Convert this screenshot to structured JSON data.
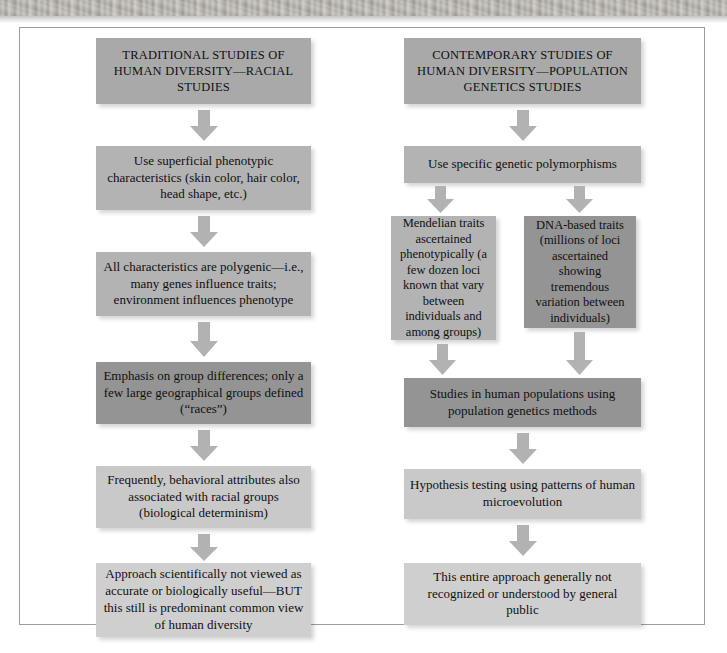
{
  "figure": {
    "type": "flowchart",
    "columns": 2
  },
  "colors": {
    "box_header": "#a9a9a9",
    "box_mid": "#b3b3b3",
    "box_dark": "#949494",
    "box_light": "#c9c9c9",
    "box_lighter": "#cfcfcf",
    "arrow": "#b0b0b0",
    "text": "#101010",
    "frame": "#9d9d9d",
    "page_background": "#ffffff"
  },
  "left_column": {
    "header": {
      "lines": [
        "TRADITIONAL STUDIES OF",
        "HUMAN DIVERSITY—",
        "RACIAL STUDIES"
      ],
      "text": "TRADITIONAL STUDIES OF HUMAN DIVERSITY—RACIAL STUDIES",
      "tone": "header"
    },
    "steps": [
      {
        "id": "left-step-1",
        "lines": [
          "Use superficial phenotypic",
          "characteristics (skin color, hair color,",
          "head shape, etc.)"
        ],
        "text": "Use superficial phenotypic characteristics (skin color, hair color, head shape, etc.)",
        "tone": "mid"
      },
      {
        "id": "left-step-2",
        "lines": [
          "All characteristics are polygenic—",
          "i.e., many genes influence traits;",
          "environment influences phenotype"
        ],
        "text": "All characteristics are polygenic—i.e., many genes influence traits; environment influences phenotype",
        "tone": "mid"
      },
      {
        "id": "left-step-3",
        "lines": [
          "Emphasis on group differences;",
          "only a few large geographical",
          "groups defined (“races”)"
        ],
        "text": "Emphasis on group differences; only a few large geographical groups defined (“races”)",
        "tone": "dark"
      },
      {
        "id": "left-step-4",
        "lines": [
          "Frequently, behavioral attributes",
          "also associated with racial groups",
          "(biological determinism)"
        ],
        "text": "Frequently, behavioral attributes also associated with racial groups (biological determinism)",
        "tone": "light"
      },
      {
        "id": "left-step-5",
        "lines": [
          "Approach scientifically not viewed",
          "as accurate or biologically useful—",
          "BUT this still is predominant",
          "common view of human diversity"
        ],
        "text": "Approach scientifically not viewed as accurate or biologically useful—BUT this still is predominant common view of human diversity",
        "tone": "lighter"
      }
    ]
  },
  "right_column": {
    "header": {
      "lines": [
        "CONTEMPORARY STUDIES OF",
        "HUMAN DIVERSITY—",
        "POPULATION GENETICS  STUDIES"
      ],
      "text": "CONTEMPORARY STUDIES OF HUMAN DIVERSITY—POPULATION GENETICS  STUDIES",
      "tone": "header"
    },
    "steps": [
      {
        "id": "right-step-1",
        "lines": [
          "Use specific genetic polymorphisms"
        ],
        "text": "Use specific genetic polymorphisms",
        "tone": "mid"
      },
      {
        "id": "right-branch-left",
        "lines": [
          "Mendelian traits",
          "ascertained pheno-",
          "typically (a few",
          "dozen loci known",
          "that vary between",
          "individuals and",
          "among groups)"
        ],
        "text": "Mendelian traits ascertained phenotypically (a few dozen loci known that vary between individuals and among groups)",
        "tone": "mid"
      },
      {
        "id": "right-branch-right",
        "lines": [
          "DNA-based traits",
          "(millions of loci",
          "ascertained show-",
          "ing tremendous",
          "variation between",
          "individuals)"
        ],
        "text": "DNA-based traits (millions of loci ascertained showing tremendous variation between individuals)",
        "tone": "dark"
      },
      {
        "id": "right-step-2",
        "lines": [
          "Studies in human populations",
          "using population genetics methods"
        ],
        "text": "Studies in human populations using population genetics methods",
        "tone": "dark"
      },
      {
        "id": "right-step-3",
        "lines": [
          "Hypothesis testing using patterns",
          "of human microevolution"
        ],
        "text": "Hypothesis testing using patterns of human microevolution",
        "tone": "light"
      },
      {
        "id": "right-step-4",
        "lines": [
          "This entire approach generally not",
          "recognized or understood by",
          "general public"
        ],
        "text": "This entire approach generally not recognized or understood by general public",
        "tone": "lighter"
      }
    ]
  },
  "arrows": {
    "count": 11,
    "direction": "down",
    "color": "#b0b0b0"
  }
}
